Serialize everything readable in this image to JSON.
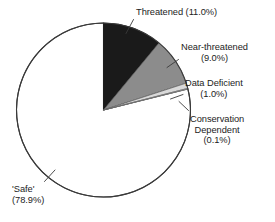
{
  "chart_data": {
    "type": "pie",
    "title": "",
    "subtitle": "",
    "xlabel": "",
    "ylabel": "",
    "legend_position": "none",
    "grid": false,
    "start_angle_deg": 0,
    "direction": "clockwise",
    "units": "percent",
    "categories": [
      "Threatened",
      "Near-threatened",
      "Data Deficient",
      "Conservation Dependent",
      "'Safe'"
    ],
    "values": [
      11.0,
      9.0,
      1.0,
      0.1,
      78.9
    ],
    "colors": [
      "#1a1a1a",
      "#8c8c8c",
      "#d9d9d9",
      "#f2f2f2",
      "#ffffff"
    ],
    "slices": [
      {
        "label": "Threatened",
        "value": 11.0,
        "value_text": "(11.0%)",
        "color": "#1a1a1a",
        "start_deg": 0.0,
        "end_deg": 39.6
      },
      {
        "label": "Near-threatened",
        "value": 9.0,
        "value_text": "(9.0%)",
        "color": "#8c8c8c",
        "start_deg": 39.6,
        "end_deg": 72.0
      },
      {
        "label": "Data Deficient",
        "value": 1.0,
        "value_text": "(1.0%)",
        "color": "#d9d9d9",
        "start_deg": 72.0,
        "end_deg": 75.6
      },
      {
        "label": "Conservation Dependent",
        "value": 0.1,
        "value_text": "(0.1%)",
        "color": "#f2f2f2",
        "start_deg": 75.6,
        "end_deg": 75.96
      },
      {
        "label": "'Safe'",
        "value": 78.9,
        "value_text": "(78.9%)",
        "color": "#ffffff",
        "start_deg": 75.96,
        "end_deg": 360.0
      }
    ]
  },
  "labels": {
    "threatened": {
      "line1": "Threatened (11.0%)"
    },
    "near_threatened": {
      "line1": "Near-threatened",
      "line2": "(9.0%)"
    },
    "data_deficient": {
      "line1": "Data Deficient",
      "line2": "(1.0%)"
    },
    "conservation_dependent": {
      "line1": "Conservation",
      "line2": "Dependent",
      "line3": "(0.1%)"
    },
    "safe": {
      "line1": "'Safe'",
      "line2": "(78.9%)"
    }
  },
  "style": {
    "outline_color": "#3a3a3a",
    "leader_color": "#3a3a3a",
    "background": "#ffffff",
    "text_color": "#1c1c1c"
  }
}
